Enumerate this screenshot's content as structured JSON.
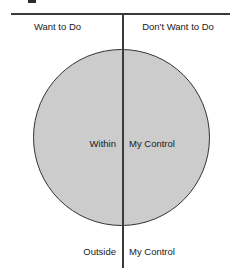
{
  "diagram": {
    "title_fragment": "",
    "colors": {
      "circle_fill": "#cccccc",
      "circle_stroke": "#333333",
      "axis": "#3a3a3a",
      "text": "#1a1a1a",
      "background": "#ffffff"
    },
    "axes": {
      "horizontal_name": "horizontal-divider",
      "vertical_name": "vertical-divider"
    },
    "quadrant_labels": {
      "top_left": "Want to Do",
      "top_right": "Don't Want to Do"
    },
    "circle_labels": {
      "inside_left": "Within",
      "inside_right": "My Control"
    },
    "outside_labels": {
      "bottom_left": "Outside",
      "bottom_right": "My Control"
    }
  }
}
